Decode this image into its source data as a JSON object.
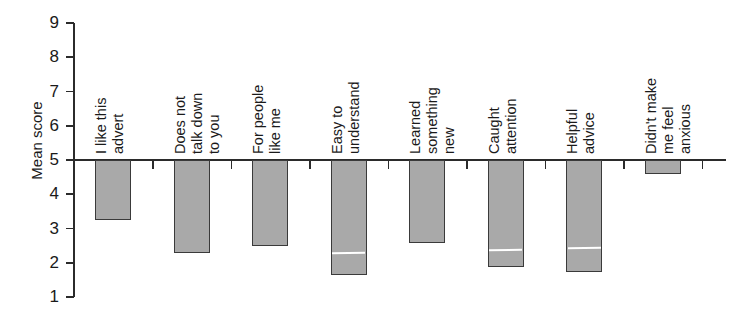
{
  "chart_data": {
    "type": "bar",
    "title": "",
    "subtitle": "",
    "xlabel": "",
    "ylabel": "Mean score",
    "ylim": [
      1,
      9
    ],
    "baseline": 5,
    "grid": false,
    "legend": "none",
    "orientation": "vertical-downward-from-baseline",
    "ytick_labels": [
      "9",
      "8",
      "7",
      "6",
      "5",
      "4",
      "3",
      "2",
      "1"
    ],
    "ytick_values": [
      9,
      8,
      7,
      6,
      5,
      4,
      3,
      2,
      1
    ],
    "categories": [
      "I like this advert",
      "Does not talk down to you",
      "For people like me",
      "Easy to understand",
      "Learned something new",
      "Caught attention",
      "Helpful advice",
      "Didn't make me feel anxious"
    ],
    "category_label_lines": [
      [
        "I like this",
        "advert"
      ],
      [
        "Does not",
        "talk down",
        "to you"
      ],
      [
        "For people",
        "like me"
      ],
      [
        "Easy to",
        "understand"
      ],
      [
        "Learned",
        "something",
        "new"
      ],
      [
        "Caught",
        "attention"
      ],
      [
        "Helpful",
        "advice"
      ],
      [
        "Didn't make",
        "me feel",
        "anxious"
      ]
    ],
    "values": [
      3.25,
      2.28,
      2.5,
      1.65,
      2.57,
      1.87,
      1.73,
      4.6
    ],
    "markers": [
      null,
      null,
      null,
      2.3,
      null,
      2.4,
      2.45,
      null
    ],
    "colors": {
      "bar_fill": "#a9a9a9",
      "bar_border": "#3a3a3a",
      "axis": "#2b2b2b",
      "marker": "#ffffff",
      "background": "#ffffff",
      "text": "#1a1a1a"
    }
  }
}
